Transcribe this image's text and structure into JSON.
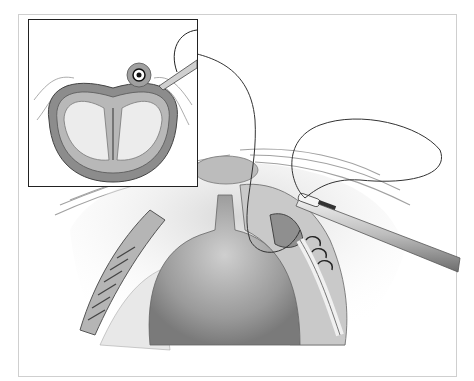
{
  "illustration": {
    "type": "grayscale surgical illustration",
    "colors": {
      "background": "#ffffff",
      "frame_border": "#cfcfcf",
      "inset_border": "#222222",
      "tissue_light": "#e6e6e6",
      "tissue_mid": "#a8a8a8",
      "tissue_dark": "#555555",
      "suture": "#333333"
    },
    "elements": [
      "inset-cross-section",
      "main-surgical-field",
      "needle-holder-instrument",
      "suture-thread",
      "sutured-incision"
    ]
  }
}
